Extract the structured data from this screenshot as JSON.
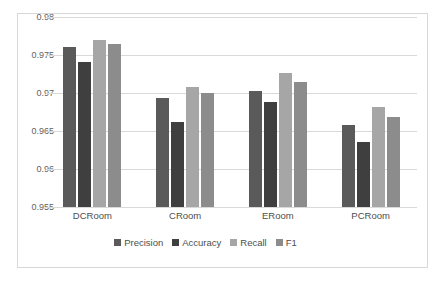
{
  "chart_data": {
    "type": "bar",
    "title": "",
    "xlabel": "",
    "ylabel": "",
    "categories": [
      "DCRoom",
      "CRoom",
      "ERoom",
      "PCRoom"
    ],
    "series": [
      {
        "name": "Precision",
        "color": "#5a5a5a",
        "values": [
          0.9761,
          0.9693,
          0.9703,
          0.9658
        ]
      },
      {
        "name": "Accuracy",
        "color": "#3f3f3f",
        "values": [
          0.9741,
          0.9662,
          0.9688,
          0.9635
        ]
      },
      {
        "name": "Recall",
        "color": "#a6a6a6",
        "values": [
          0.977,
          0.9708,
          0.9726,
          0.9681
        ]
      },
      {
        "name": "F1",
        "color": "#8c8c8c",
        "values": [
          0.9765,
          0.97,
          0.9714,
          0.9669
        ]
      }
    ],
    "ylim": [
      0.955,
      0.98
    ],
    "yticks": [
      0.955,
      0.96,
      0.965,
      0.97,
      0.975,
      0.98
    ],
    "ytick_labels": [
      "0.955",
      "0.96",
      "0.965",
      "0.97",
      "0.975",
      "0.98"
    ],
    "grid": true,
    "legend_position": "bottom",
    "legend_entries": [
      "Precision",
      "Accuracy",
      "Recall",
      "F1"
    ],
    "plot_background": "#ffffff",
    "gridline_color": "#d9d9d9",
    "border_color": "#d8d8d8"
  }
}
